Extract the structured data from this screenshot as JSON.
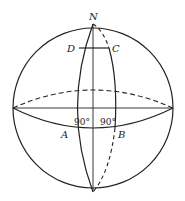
{
  "diagram": {
    "type": "sphere-geometry",
    "points": {
      "N": "N",
      "D": "D",
      "C": "C",
      "A": "A",
      "B": "B"
    },
    "angles": {
      "angle_A": "90°",
      "angle_B": "90°"
    },
    "colors": {
      "stroke": "#222222",
      "background": "#ffffff"
    }
  }
}
